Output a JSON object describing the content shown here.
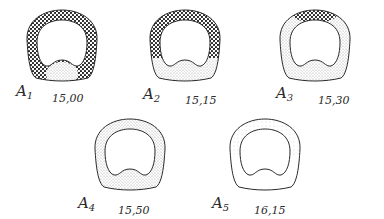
{
  "figure": {
    "panels": [
      {
        "id": "A1",
        "letter": "A",
        "index": "1",
        "time": "15,00",
        "dense_coverage": "full ring except bottom",
        "description": "Cross-section with heavy dark stippling around entire ring; light stipple in bottom bulge"
      },
      {
        "id": "A2",
        "letter": "A",
        "index": "2",
        "time": "15,15",
        "dense_coverage": "upper two-thirds",
        "description": "Dark stippling on upper ring, light stipple in lower third"
      },
      {
        "id": "A3",
        "letter": "A",
        "index": "3",
        "time": "15,30",
        "dense_coverage": "top cap only",
        "description": "Dark stippling limited to top; rest light stipple"
      },
      {
        "id": "A4",
        "letter": "A",
        "index": "4",
        "time": "15,50",
        "dense_coverage": "none",
        "description": "Entire ring light stipple"
      },
      {
        "id": "A5",
        "letter": "A",
        "index": "5",
        "time": "16,15",
        "dense_coverage": "none",
        "description": "Faint stipple only in upper part of ring"
      }
    ]
  },
  "colors": {
    "ink": "#2a2a2a",
    "dense": "#1a1a1a",
    "light": "#9a9a9a",
    "background": "#ffffff"
  }
}
